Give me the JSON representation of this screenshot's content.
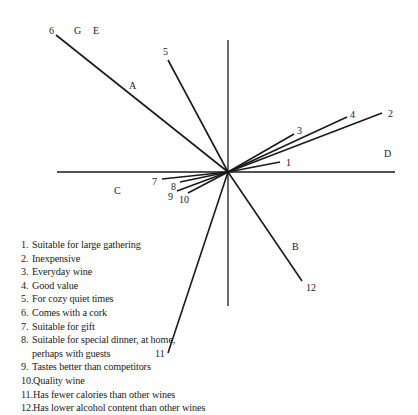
{
  "figure": {
    "title": "",
    "origin": {
      "x": 228,
      "y": 172
    },
    "axes": {
      "horizontal": {
        "x1": 57,
        "x2": 395,
        "y": 172
      },
      "vertical": {
        "x": 228,
        "y1": 40,
        "y2": 306
      }
    },
    "vectors": [
      {
        "id": "1",
        "end": [
          280,
          162
        ],
        "label": "1",
        "label_pos": [
          286,
          166
        ]
      },
      {
        "id": "2",
        "end": [
          382,
          113
        ],
        "label": "2",
        "label_pos": [
          388,
          117
        ]
      },
      {
        "id": "3",
        "end": [
          294,
          134
        ],
        "label": "3",
        "label_pos": [
          297,
          134
        ]
      },
      {
        "id": "4",
        "end": [
          347,
          117
        ],
        "label": "4",
        "label_pos": [
          350,
          118
        ]
      },
      {
        "id": "5",
        "end": [
          168,
          60
        ],
        "label": "5",
        "label_pos": [
          163,
          55
        ]
      },
      {
        "id": "6",
        "end": [
          56,
          35
        ],
        "label": "6",
        "label_pos": [
          49,
          34
        ]
      },
      {
        "id": "7",
        "end": [
          162,
          179
        ],
        "label": "7",
        "label_pos": [
          152,
          185
        ]
      },
      {
        "id": "8",
        "end": [
          180,
          182
        ],
        "label": "8",
        "label_pos": [
          171,
          190
        ]
      },
      {
        "id": "9",
        "end": [
          177,
          191
        ],
        "label": "9",
        "label_pos": [
          168,
          200
        ]
      },
      {
        "id": "10",
        "end": [
          188,
          193
        ],
        "label": "10",
        "label_pos": [
          179,
          203
        ]
      },
      {
        "id": "11",
        "end": [
          168,
          353
        ],
        "label": "11",
        "label_pos": [
          155,
          357
        ]
      },
      {
        "id": "12",
        "end": [
          302,
          281
        ],
        "label": "12",
        "label_pos": [
          306,
          291
        ]
      }
    ],
    "segment_labels": [
      {
        "label": "A",
        "pos": [
          129,
          89
        ]
      },
      {
        "label": "B",
        "pos": [
          292,
          250
        ]
      },
      {
        "label": "C",
        "pos": [
          114,
          194
        ]
      },
      {
        "label": "D",
        "pos": [
          384,
          157
        ]
      },
      {
        "label": "E",
        "pos": [
          93,
          34
        ]
      },
      {
        "label": "G",
        "pos": [
          74,
          34
        ]
      }
    ]
  },
  "legend": {
    "items": [
      {
        "num": "1.",
        "text": "Suitable for large gathering"
      },
      {
        "num": "2.",
        "text": "Inexpensive"
      },
      {
        "num": "3.",
        "text": "Everyday wine"
      },
      {
        "num": "4.",
        "text": "Good value"
      },
      {
        "num": "5.",
        "text": "For cozy quiet times"
      },
      {
        "num": "6.",
        "text": "Comes with a cork"
      },
      {
        "num": "7.",
        "text": "Suitable for gift"
      },
      {
        "num": "8.",
        "text": "Suitable for special dinner, at home,\nperhaps with guests"
      },
      {
        "num": "9.",
        "text": "Tastes better than competitors"
      },
      {
        "num": "10.",
        "text": "Quality wine"
      },
      {
        "num": "11.",
        "text": "Has fewer calories than other wines"
      },
      {
        "num": "12.",
        "text": "Has lower alcohol content than other wines"
      }
    ]
  },
  "colors": {
    "ink": "#1a1a1a",
    "background": "#ffffff"
  }
}
